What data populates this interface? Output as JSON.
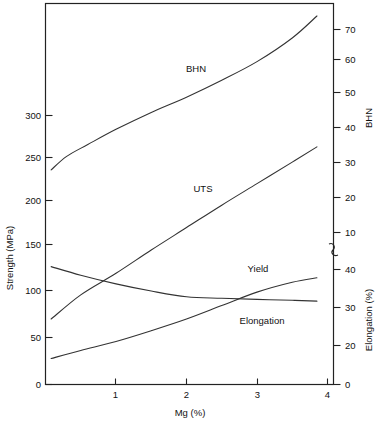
{
  "chart_data": {
    "type": "line",
    "title": "",
    "xlabel": "Mg (%)",
    "ylabel": "Strength (MPa)",
    "y2label_upper": "BHN",
    "y2label_lower": "Elongation (%)",
    "xlim": [
      0,
      4.25
    ],
    "xticks": [
      1,
      2,
      3,
      4
    ],
    "xticklabels": [
      "1",
      "2",
      "3",
      "4"
    ],
    "ylim": [
      0,
      425
    ],
    "yticks": [
      0,
      50,
      100,
      150,
      200,
      250,
      300
    ],
    "yticklabels": [
      "0",
      "50",
      "100",
      "150",
      "200",
      "250",
      "300"
    ],
    "y2_upper_ticks": [
      10,
      20,
      30,
      40,
      50,
      60,
      70
    ],
    "y2_upper_ticklabels": [
      "10",
      "20",
      "30",
      "40",
      "50",
      "60",
      "70"
    ],
    "y2_lower_ticks": [
      0,
      20,
      30,
      40
    ],
    "y2_lower_ticklabels": [
      "0",
      "20",
      "30",
      "40"
    ],
    "axis_break": true,
    "grid": false,
    "legend_position": "inline-labels",
    "series": [
      {
        "name": "BHN",
        "axis": "right-upper",
        "label": "BHN",
        "x": [
          0.08,
          0.3,
          0.6,
          1.0,
          1.5,
          2.0,
          2.5,
          3.0,
          3.5,
          3.85
        ],
        "values": [
          28.5,
          32.5,
          36.0,
          40.5,
          45.5,
          50.0,
          55.0,
          60.5,
          67.5,
          74.0
        ]
      },
      {
        "name": "UTS",
        "axis": "left",
        "label": "UTS",
        "x": [
          0.08,
          0.5,
          1.0,
          1.5,
          2.0,
          2.5,
          3.0,
          3.5,
          3.85
        ],
        "values": [
          73,
          100,
          124,
          150,
          175,
          200,
          224,
          248,
          265
        ]
      },
      {
        "name": "Yield",
        "axis": "left",
        "label": "Yield",
        "x": [
          0.08,
          0.5,
          1.0,
          1.5,
          2.0,
          2.5,
          3.0,
          3.5,
          3.85
        ],
        "values": [
          29,
          38,
          48,
          60,
          73,
          88,
          103,
          114,
          119
        ]
      },
      {
        "name": "Elongation",
        "axis": "right-lower",
        "label": "Elongation",
        "x": [
          0.08,
          0.5,
          1.0,
          1.5,
          2.0,
          2.5,
          3.0,
          3.5,
          3.85
        ],
        "values": [
          41.0,
          38.0,
          35.0,
          32.5,
          30.5,
          30.0,
          29.6,
          29.3,
          29.0
        ]
      }
    ],
    "annotations": [
      {
        "text": "BHN",
        "x_px": 196,
        "y_px": 72
      },
      {
        "text": "UTS",
        "x_px": 203,
        "y_px": 192
      },
      {
        "text": "Yield",
        "x_px": 258,
        "y_px": 272
      },
      {
        "text": "Elongation",
        "x_px": 258,
        "y_px": 324
      }
    ]
  },
  "colors": {
    "background": "#ffffff",
    "axis": "#222222",
    "curve": "#333333",
    "text": "#111111"
  }
}
